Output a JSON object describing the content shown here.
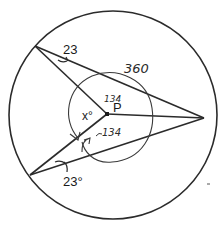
{
  "diagram": {
    "type": "geometry",
    "circle": {
      "cx": 113,
      "cy": 115,
      "r": 104,
      "stroke": "#2b2b2b"
    },
    "points": {
      "A": {
        "x": 35,
        "y": 46
      },
      "B": {
        "x": 204,
        "y": 118
      },
      "C": {
        "x": 30,
        "y": 175
      },
      "P": {
        "x": 107,
        "y": 114
      }
    },
    "segments": [
      {
        "from": "A",
        "to": "B"
      },
      {
        "from": "A",
        "to": "P"
      },
      {
        "from": "P",
        "to": "B"
      },
      {
        "from": "C",
        "to": "B"
      },
      {
        "from": "C",
        "to": "P"
      }
    ],
    "labels": {
      "angle_top": "23",
      "angle_bottom": "23°",
      "center_point": "P",
      "unknown_angle": "x°",
      "hand_total": "360",
      "hand_upper_angle": "134",
      "hand_lower_angle": "134"
    },
    "colors": {
      "ink": "#2b2b2b",
      "pencil": "#3a3a3a",
      "background": "#ffffff"
    }
  }
}
